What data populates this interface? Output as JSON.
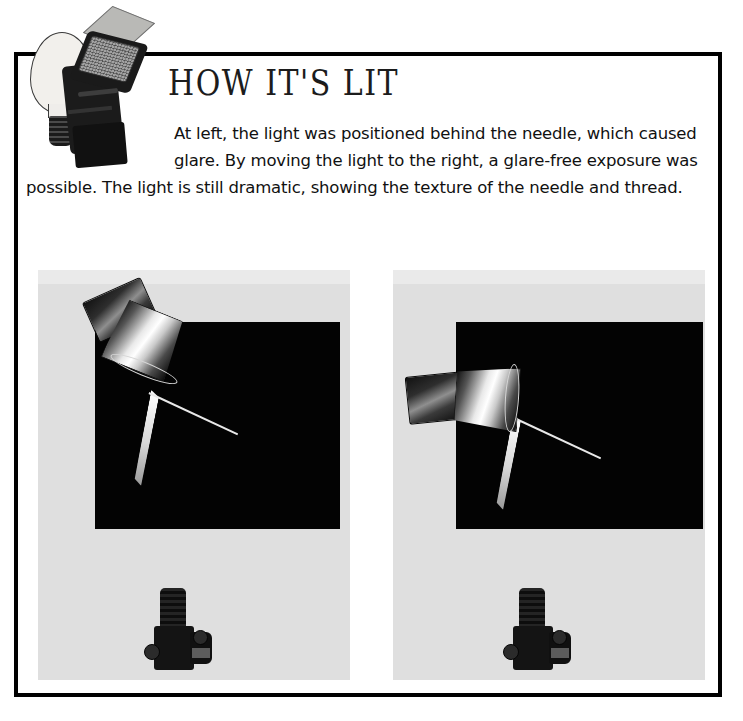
{
  "page": {
    "title": "How It's Lit",
    "background_color": "#ffffff",
    "frame_color": "#000000"
  },
  "header": {
    "heading": "HOW IT'S LIT",
    "icon_name": "lightbulb-flash-icon",
    "icon_parts": {
      "bulb": "light-bulb",
      "flash": "camera-flash-unit",
      "bounce_card": "flash-bounce-card"
    }
  },
  "body": {
    "paragraph": "At left, the light was positioned behind the needle, which caused glare. By moving the light to the right, a glare-free exposure was possible.  The light is still dramatic, showing the texture of the needle and thread."
  },
  "panels": [
    {
      "id": "panel-left",
      "name": "lighting-diagram-left",
      "caption_role": "light behind the needle causing glare",
      "background_color": "#dfdfdf",
      "photo_color": "#030303",
      "light_position": "upper-left, aimed down-right behind subject",
      "camera_position": "bottom-center, lens aimed up toward subject",
      "subject": "needle-and-thread"
    },
    {
      "id": "panel-right",
      "name": "lighting-diagram-right",
      "caption_role": "light moved to the right for a glare-free exposure",
      "background_color": "#dfdfdf",
      "photo_color": "#030303",
      "light_position": "mid-left, aimed horizontally to the right",
      "camera_position": "bottom-center, lens aimed up toward subject",
      "subject": "needle-and-thread"
    }
  ],
  "colors": {
    "ink": "#111111",
    "panel_gray": "#dfdfdf",
    "panel_band": "#eaeaea",
    "photo_black": "#030303",
    "needle_highlight": "#ffffff"
  }
}
